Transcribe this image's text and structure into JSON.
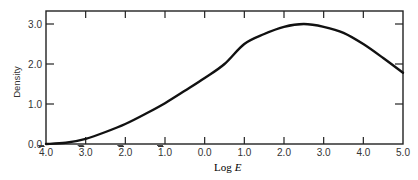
{
  "chart_data": {
    "type": "line",
    "title": "",
    "xlabel": "Log E",
    "ylabel": "Density",
    "xlim": [
      -4.0,
      5.0
    ],
    "ylim": [
      0.0,
      3.2
    ],
    "grid": false,
    "legend": null,
    "x_ticks": [
      -4.0,
      -3.0,
      -2.0,
      -1.0,
      0.0,
      1.0,
      2.0,
      3.0,
      4.0,
      5.0
    ],
    "x_tick_labels": [
      {
        "bar": "4",
        "rest": ".0"
      },
      {
        "bar": "3",
        "rest": ".0"
      },
      {
        "bar": "2",
        "rest": ".0"
      },
      {
        "bar": "1",
        "rest": ".0"
      },
      {
        "bar": "",
        "rest": "0.0"
      },
      {
        "bar": "",
        "rest": "1.0"
      },
      {
        "bar": "",
        "rest": "2.0"
      },
      {
        "bar": "",
        "rest": "3.0"
      },
      {
        "bar": "",
        "rest": "4.0"
      },
      {
        "bar": "",
        "rest": "5.0"
      }
    ],
    "y_ticks": [
      0.0,
      1.0,
      2.0,
      3.0
    ],
    "y_tick_labels": [
      "0.0",
      "1.0",
      "2.0",
      "3.0"
    ],
    "series": [
      {
        "name": "Density",
        "color": "#111111",
        "x": [
          -4.0,
          -3.5,
          -3.0,
          -2.5,
          -2.0,
          -1.5,
          -1.0,
          -0.5,
          0.0,
          0.5,
          1.0,
          1.5,
          2.0,
          2.5,
          3.0,
          3.5,
          4.0,
          4.5,
          5.0
        ],
        "y": [
          0.0,
          0.03,
          0.13,
          0.3,
          0.5,
          0.75,
          1.02,
          1.33,
          1.65,
          2.0,
          2.5,
          2.75,
          2.93,
          3.0,
          2.93,
          2.78,
          2.5,
          2.15,
          1.78
        ]
      }
    ]
  }
}
